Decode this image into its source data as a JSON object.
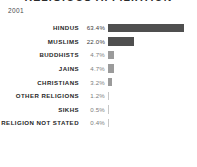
{
  "chart_title": "RELIGIOUS AFFILIATION",
  "year_label": "2001",
  "colors": {
    "bar_major": "#4f4f4f",
    "bar_minor": "#9b9b9b",
    "bar_hairline": "#c7c7c7",
    "label_text": "#1f1f1f",
    "value_text": "#7d7d7d",
    "background": "#ffffff"
  },
  "chart_data": {
    "type": "bar",
    "orientation": "horizontal",
    "title": "RELIGIOUS AFFILIATION",
    "subtitle": "2001",
    "xlabel": "",
    "ylabel": "",
    "xlim": [
      0,
      63.4
    ],
    "grid": false,
    "legend": "none",
    "categories": [
      "HINDUS",
      "MUSLIMS",
      "BUDDHISTS",
      "JAINS",
      "CHRISTIANS",
      "OTHER RELIGIONS",
      "SIKHS",
      "RELIGION NOT STATED"
    ],
    "values": [
      63.4,
      22.0,
      4.7,
      4.7,
      3.2,
      1.2,
      0.5,
      0.4
    ],
    "value_labels": [
      "63.4%",
      "22.0%",
      "4.7%",
      "4.7%",
      "3.2%",
      "1.2%",
      "0.5%",
      "0.4%"
    ]
  },
  "rows": [
    {
      "label": "HINDUS",
      "value": "63.4%",
      "pct": 63.4,
      "style": "big"
    },
    {
      "label": "MUSLIMS",
      "value": "22.0%",
      "pct": 22.0,
      "style": "big"
    },
    {
      "label": "BUDDHISTS",
      "value": "4.7%",
      "pct": 4.7,
      "style": "faint"
    },
    {
      "label": "JAINS",
      "value": "4.7%",
      "pct": 4.7,
      "style": "faint"
    },
    {
      "label": "CHRISTIANS",
      "value": "3.2%",
      "pct": 3.2,
      "style": "faint"
    },
    {
      "label": "OTHER RELIGIONS",
      "value": "1.2%",
      "pct": 1.2,
      "style": "hairline"
    },
    {
      "label": "SIKHS",
      "value": "0.5%",
      "pct": 0.5,
      "style": "hairline"
    },
    {
      "label": "RELIGION NOT STATED",
      "value": "0.4%",
      "pct": 0.4,
      "style": "hairline"
    }
  ]
}
